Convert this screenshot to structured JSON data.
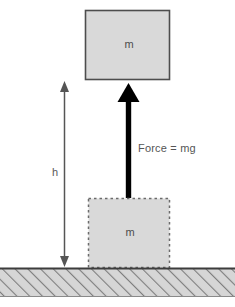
{
  "diagram": {
    "type": "physics-free-body-diagram",
    "colors": {
      "box_fill": "#d9d9d9",
      "box_stroke_solid": "#4d4d4d",
      "box_stroke_dashed": "#6b6b6b",
      "force_arrow": "#000000",
      "height_arrow": "#555555",
      "ground_fill": "#d4d4d4",
      "ground_hatch": "#7a7a7a",
      "ground_line": "#3d3d3d",
      "text": "#4d4d4d",
      "background": "#ffffff"
    }
  },
  "labels": {
    "mass_top": "m",
    "mass_bottom": "m",
    "force": "Force = mg",
    "height": "h"
  },
  "objects": {
    "top_block": {
      "name": "raised-block",
      "label": "m",
      "style": "solid-outline",
      "x": 85,
      "y": 10,
      "width": 85,
      "height": 70
    },
    "bottom_block": {
      "name": "ground-block-ghost",
      "label": "m",
      "style": "dashed-outline",
      "x": 88,
      "y": 198,
      "width": 82,
      "height": 70
    },
    "force_arrow": {
      "name": "force-arrow",
      "direction": "up",
      "label": "Force = mg",
      "tip_y": 84,
      "tail_y": 198,
      "x": 128
    },
    "height_arrow": {
      "name": "height-dimension-arrow",
      "direction": "double",
      "label": "h",
      "top_y": 82,
      "bottom_y": 266,
      "x": 64
    },
    "ground": {
      "name": "ground-hatched",
      "y": 268,
      "height": 29,
      "hatch_direction": "up-right"
    }
  }
}
